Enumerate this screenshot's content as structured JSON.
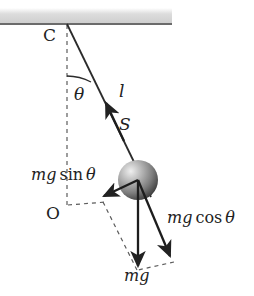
{
  "figure": {
    "width": 254,
    "height": 296,
    "background_color": "#ffffff",
    "stroke_color": "#222222",
    "ceiling_color": "#d8d8d8",
    "bob_light_color": "#e8e8e8",
    "bob_dark_color": "#4a4a4a"
  },
  "labels": {
    "pivot": "C",
    "origin": "O",
    "angle": "θ",
    "length": "l",
    "tension": "S",
    "mg_sin_theta_part1": "mg",
    "mg_sin_theta_part2": "sin",
    "mg_sin_theta_part3": "θ",
    "mg_cos_theta_part1": "mg",
    "mg_cos_theta_part2": "cos",
    "mg_cos_theta_part3": "θ",
    "weight": "mg"
  },
  "geometry": {
    "ceiling_y": 24,
    "ceiling_x_end": 172,
    "pivot": {
      "x": 67,
      "y": 24
    },
    "bob_center": {
      "x": 138,
      "y": 180
    },
    "bob_radius": 20,
    "vertical_dashed_end": {
      "x": 67,
      "y": 206
    },
    "arc_radius": 52,
    "mg_sin_arrow_tip": {
      "x": 101,
      "y": 198
    },
    "mg_cos_arrow_tip": {
      "x": 172,
      "y": 259
    },
    "mg_arrow_tip": {
      "x": 138,
      "y": 269
    },
    "tension_arrow_tip": {
      "x": 107,
      "y": 103
    },
    "string_top": {
      "x": 67,
      "y": 24
    },
    "string_bottom": {
      "x": 150,
      "y": 196
    }
  }
}
